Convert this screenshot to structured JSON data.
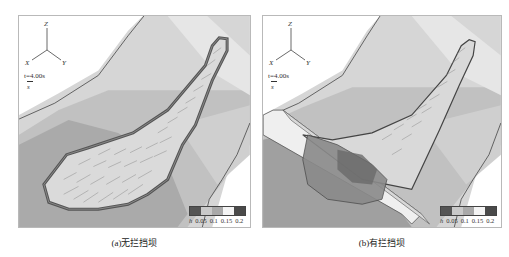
{
  "figure": {
    "panels": [
      {
        "id": "a",
        "caption": "(a)无拦挡坝",
        "axes": {
          "z": "Z",
          "x": "X",
          "y": "Y"
        },
        "time_label": "t=4.00s",
        "vector_label": "s",
        "legend": {
          "variable": "h",
          "ticks": [
            "0.05",
            "0.1",
            "0.15",
            "0.2"
          ],
          "colors": [
            "#555555",
            "#c9c9c9",
            "#a9a9a9",
            "#f4f4f4",
            "#4a4a4a"
          ]
        },
        "has_dam": false
      },
      {
        "id": "b",
        "caption": "(b)有拦挡坝",
        "axes": {
          "z": "Z",
          "x": "X",
          "y": "Y"
        },
        "time_label": "t=4.00s",
        "vector_label": "s",
        "legend": {
          "variable": "h",
          "ticks": [
            "0.05",
            "0.1",
            "0.15",
            "0.2"
          ],
          "colors": [
            "#555555",
            "#c9c9c9",
            "#a9a9a9",
            "#f4f4f4",
            "#4a4a4a"
          ]
        },
        "has_dam": true
      }
    ],
    "colors": {
      "terrain_dark": "#9a9a9a",
      "terrain_mid": "#b4b4b4",
      "terrain_light": "#d2d2d2",
      "terrain_pale": "#e2e2e2",
      "flow_fill": "#dcdcdc",
      "flow_edge": "#555555",
      "dam_face": "#efefef"
    }
  }
}
